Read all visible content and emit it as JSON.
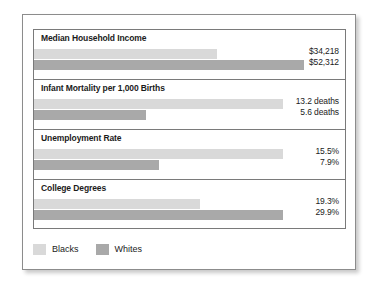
{
  "legend": {
    "items": [
      {
        "label": "Blacks",
        "color": "#d9d9d9"
      },
      {
        "label": "Whites",
        "color": "#a9a9a9"
      }
    ]
  },
  "chart_data": {
    "type": "bar",
    "title": "",
    "xlabel": "",
    "ylabel": "",
    "grid": false,
    "legend_position": "bottom-left",
    "series": [
      {
        "name": "Blacks",
        "color": "#d9d9d9"
      },
      {
        "name": "Whites",
        "color": "#a9a9a9"
      }
    ],
    "categories": [
      "Median Household Income",
      "Infant Mortality per 1,000 Births",
      "Unemployment Rate",
      "College Degrees"
    ],
    "groups": [
      {
        "category": "Median Household Income",
        "bars": [
          {
            "series": "Blacks",
            "value": 34218,
            "label": "$34,218",
            "bar_pct": 58.8
          },
          {
            "series": "Whites",
            "value": 52312,
            "label": "$52,312",
            "bar_pct": 86.9
          }
        ]
      },
      {
        "category": "Infant Mortality per 1,000 Births",
        "bars": [
          {
            "series": "Blacks",
            "value": 13.2,
            "label": "13.2 deaths",
            "bar_pct": 80.0
          },
          {
            "series": "Whites",
            "value": 5.6,
            "label": "5.6 deaths",
            "bar_pct": 36.0
          }
        ]
      },
      {
        "category": "Unemployment Rate",
        "bars": [
          {
            "series": "Blacks",
            "value": 15.5,
            "label": "15.5%",
            "bar_pct": 80.0
          },
          {
            "series": "Whites",
            "value": 7.9,
            "label": "7.9%",
            "bar_pct": 40.2
          }
        ]
      },
      {
        "category": "College Degrees",
        "bars": [
          {
            "series": "Blacks",
            "value": 19.3,
            "label": "19.3%",
            "bar_pct": 53.5
          },
          {
            "series": "Whites",
            "value": 29.9,
            "label": "29.9%",
            "bar_pct": 80.1
          }
        ]
      }
    ]
  }
}
